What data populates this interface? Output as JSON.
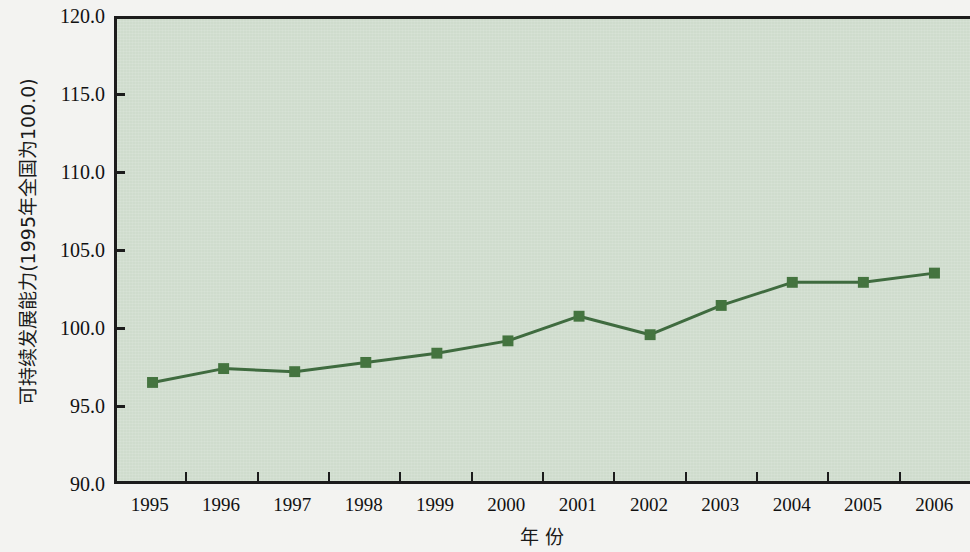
{
  "chart_data": {
    "type": "line",
    "title": "",
    "subtitle": "",
    "xlabel": "年  份",
    "ylabel": "可持续发展能力(1995年全国为100.0)",
    "categories": [
      "1995",
      "1996",
      "1997",
      "1998",
      "1999",
      "2000",
      "2001",
      "2002",
      "2003",
      "2004",
      "2005",
      "2006"
    ],
    "series": [
      {
        "name": "可持续发展能力",
        "values": [
          96.4,
          97.3,
          97.1,
          97.7,
          98.3,
          99.1,
          100.7,
          99.5,
          101.4,
          102.9,
          102.9,
          103.5
        ]
      }
    ],
    "ylim": [
      90.0,
      120.0
    ],
    "ytick_values": [
      90.0,
      95.0,
      100.0,
      105.0,
      110.0,
      115.0,
      120.0
    ],
    "ytick_labels": [
      "90.0",
      "95.0",
      "100.0",
      "105.0",
      "110.0",
      "115.0",
      "120.0"
    ],
    "grid": false,
    "legend": false,
    "legend_position": "none",
    "colors": {
      "series_line": "#3f6b3f",
      "series_marker": "#44743f",
      "plot_background": "#cfdccd",
      "axis": "#1c1c1c",
      "page_background": "#f3f3f1",
      "text": "#111111"
    },
    "marker_style": "square",
    "line_width": 3
  }
}
